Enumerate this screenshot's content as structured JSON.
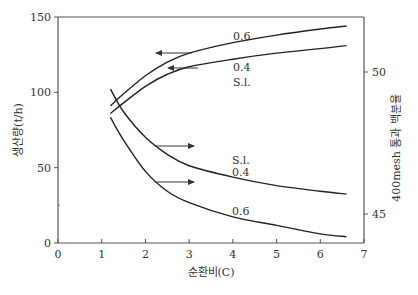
{
  "chart_data": {
    "type": "line",
    "title": "",
    "xlabel": "순환비(C)",
    "ylabel": "생산량(t/h)",
    "y2label": "400mesh 통과 백분율",
    "xlim": [
      0,
      7
    ],
    "ylim": [
      0,
      150
    ],
    "y2lim": [
      43.9,
      51.5
    ],
    "x_ticks": [
      "0",
      "1",
      "2",
      "3",
      "4",
      "5",
      "6",
      "7"
    ],
    "y_ticks": [
      "0",
      "50",
      "100",
      "150"
    ],
    "y2_ticks": [
      "45",
      "50"
    ],
    "grid": false,
    "legend": "none (curves labeled inline)",
    "series": [
      {
        "name": "0.6",
        "axis": "left",
        "metric": "생산량(t/h)",
        "x": [
          1.2,
          1.5,
          2.0,
          2.5,
          3.0,
          4.0,
          5.0,
          6.0,
          6.6
        ],
        "y": [
          91,
          99,
          111,
          120,
          126,
          133,
          138,
          142,
          144
        ]
      },
      {
        "name": "0.4 / S.l.",
        "axis": "left",
        "metric": "생산량(t/h)",
        "x": [
          1.2,
          1.5,
          2.0,
          2.5,
          3.0,
          4.0,
          5.0,
          6.0,
          6.6
        ],
        "y": [
          86,
          93,
          104,
          112,
          117,
          122,
          126,
          129,
          131
        ]
      },
      {
        "name": "S.l. / 0.4",
        "axis": "right",
        "metric": "400mesh 통과 백분율",
        "x": [
          1.2,
          1.5,
          2.0,
          2.5,
          3.0,
          4.0,
          5.0,
          6.0,
          6.6
        ],
        "y": [
          49.4,
          48.6,
          47.7,
          47.1,
          46.7,
          46.3,
          46.0,
          45.8,
          45.7
        ]
      },
      {
        "name": "0.6",
        "axis": "right",
        "metric": "400mesh 통과 백분율",
        "x": [
          1.2,
          1.5,
          2.0,
          2.5,
          3.0,
          4.0,
          5.0,
          6.0,
          6.6
        ],
        "y": [
          48.4,
          47.6,
          46.5,
          45.8,
          45.4,
          44.9,
          44.6,
          44.3,
          44.2
        ]
      }
    ],
    "annotations": [
      {
        "text": "0.6",
        "target": "upper curve (production)"
      },
      {
        "text": "0.4",
        "target": "lower production curve"
      },
      {
        "text": "S.l.",
        "target": "lower production curve"
      },
      {
        "text": "S.l.",
        "target": "upper fineness curve"
      },
      {
        "text": "0.4",
        "target": "upper fineness curve"
      },
      {
        "text": "0.6",
        "target": "lower fineness curve"
      },
      {
        "text": "← arrows",
        "meaning": "production curves read on left axis"
      },
      {
        "text": "→ arrows",
        "meaning": "fineness curves read on right axis"
      }
    ]
  },
  "labels": {
    "upper_a": "0.6",
    "upper_b": "0.4",
    "upper_c": "S.l.",
    "lower_a": "S.l.",
    "lower_b": "0.4",
    "lower_c": "0.6"
  }
}
